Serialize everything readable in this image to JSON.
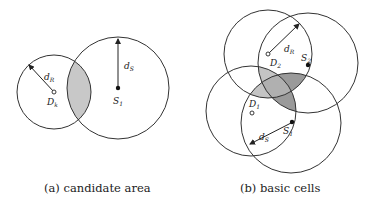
{
  "figure_a": {
    "caption": "(a) candidate area",
    "labels": {
      "dR": "d",
      "dR_sub": "R",
      "dS": "d",
      "dS_sub": "S",
      "Dk": "D",
      "Dk_sub": "k",
      "S1": "S",
      "S1_sub": "1"
    },
    "circles": [
      {
        "name": "demand-circle-Dk",
        "cx": 54,
        "cy": 92,
        "r": 37
      },
      {
        "name": "supply-circle-S1",
        "cx": 118,
        "cy": 88,
        "r": 51
      }
    ],
    "shade_color": "#c8c8c8"
  },
  "figure_b": {
    "caption": "(b) basic cells",
    "labels": {
      "dR": "d",
      "dR_sub": "R",
      "dS": "d",
      "dS_sub": "S",
      "D2": "D",
      "D2_sub": "2",
      "S2": "S",
      "S2_sub": "2",
      "D1": "D",
      "D1_sub": "1",
      "S1": "S",
      "S1_sub": "1"
    },
    "circles": [
      {
        "name": "demand-circle-D2",
        "cx": 268,
        "cy": 54,
        "r": 44
      },
      {
        "name": "supply-circle-S2",
        "cx": 308,
        "cy": 63,
        "r": 50
      },
      {
        "name": "demand-circle-D1",
        "cx": 251,
        "cy": 111,
        "r": 45
      },
      {
        "name": "supply-circle-S1",
        "cx": 291,
        "cy": 123,
        "r": 50
      }
    ],
    "shade_light": "#c4c4c4",
    "shade_dark": "#9a9a9a"
  }
}
